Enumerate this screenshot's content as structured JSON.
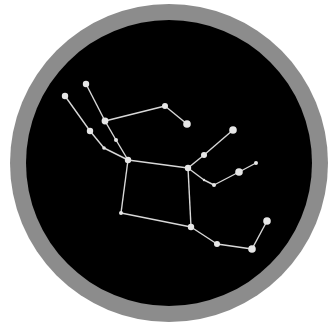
{
  "diagram": {
    "type": "constellation-map",
    "width": 336,
    "height": 326,
    "colors": {
      "background": "#ffffff",
      "ring": "#8c8c8c",
      "sky": "#000000",
      "line": "#d8d8d8",
      "star": "#e6e6e6"
    },
    "disc": {
      "cx": 169,
      "cy": 163,
      "outer_r": 159,
      "inner_r": 143
    },
    "stars": [
      {
        "id": "s1",
        "x": 65,
        "y": 96,
        "r": 3.2
      },
      {
        "id": "s2",
        "x": 86,
        "y": 84,
        "r": 3.2
      },
      {
        "id": "s3",
        "x": 105,
        "y": 121,
        "r": 3.4
      },
      {
        "id": "s4",
        "x": 90,
        "y": 131,
        "r": 3.2
      },
      {
        "id": "s5",
        "x": 116,
        "y": 140,
        "r": 2.0
      },
      {
        "id": "s6",
        "x": 104,
        "y": 148,
        "r": 1.8
      },
      {
        "id": "s7",
        "x": 128,
        "y": 160,
        "r": 3.2
      },
      {
        "id": "s8",
        "x": 165,
        "y": 106,
        "r": 3.0
      },
      {
        "id": "s9",
        "x": 187,
        "y": 124,
        "r": 3.8
      },
      {
        "id": "s10",
        "x": 188,
        "y": 168,
        "r": 3.2
      },
      {
        "id": "s11",
        "x": 204,
        "y": 155,
        "r": 3.0
      },
      {
        "id": "s12",
        "x": 233,
        "y": 130,
        "r": 3.8
      },
      {
        "id": "s13",
        "x": 204,
        "y": 180,
        "r": 1.2
      },
      {
        "id": "s14",
        "x": 214,
        "y": 185,
        "r": 2.0
      },
      {
        "id": "s15",
        "x": 239,
        "y": 172,
        "r": 3.8
      },
      {
        "id": "s16",
        "x": 256,
        "y": 163,
        "r": 2.0
      },
      {
        "id": "s17",
        "x": 121,
        "y": 213,
        "r": 2.0
      },
      {
        "id": "s18",
        "x": 191,
        "y": 227,
        "r": 3.2
      },
      {
        "id": "s19",
        "x": 217,
        "y": 244,
        "r": 3.0
      },
      {
        "id": "s20",
        "x": 252,
        "y": 249,
        "r": 3.8
      },
      {
        "id": "s21",
        "x": 267,
        "y": 221,
        "r": 3.8
      }
    ],
    "lines": [
      [
        "s1",
        "s4"
      ],
      [
        "s4",
        "s6"
      ],
      [
        "s6",
        "s7"
      ],
      [
        "s2",
        "s3"
      ],
      [
        "s3",
        "s5"
      ],
      [
        "s5",
        "s7"
      ],
      [
        "s3",
        "s8"
      ],
      [
        "s8",
        "s9"
      ],
      [
        "s7",
        "s10"
      ],
      [
        "s10",
        "s11"
      ],
      [
        "s11",
        "s12"
      ],
      [
        "s10",
        "s13"
      ],
      [
        "s13",
        "s14"
      ],
      [
        "s14",
        "s15"
      ],
      [
        "s15",
        "s16"
      ],
      [
        "s7",
        "s17"
      ],
      [
        "s17",
        "s18"
      ],
      [
        "s10",
        "s18"
      ],
      [
        "s18",
        "s19"
      ],
      [
        "s19",
        "s20"
      ],
      [
        "s20",
        "s21"
      ]
    ]
  }
}
